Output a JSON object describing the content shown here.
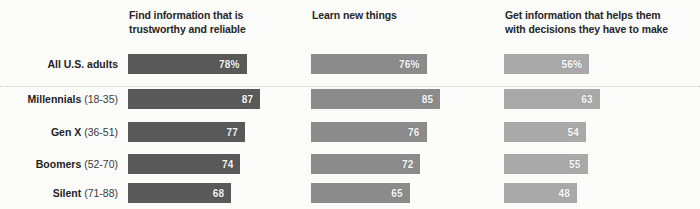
{
  "chart_data": {
    "type": "bar",
    "title": "",
    "subtitle": "",
    "xlabel": "",
    "ylabel": "",
    "orientation": "horizontal",
    "grid": false,
    "legend": "none",
    "xlim": [
      0,
      100
    ],
    "value_unit": "percent",
    "categories": [
      "All U.S. adults",
      "Millennials (18-35)",
      "Gen X (36-51)",
      "Boomers (52-70)",
      "Silent (71-88)"
    ],
    "category_parts": [
      {
        "name": "All U.S. adults",
        "age": ""
      },
      {
        "name": "Millennials",
        "age": "(18-35)"
      },
      {
        "name": "Gen X",
        "age": "(36-51)"
      },
      {
        "name": "Boomers",
        "age": "(52-70)"
      },
      {
        "name": "Silent",
        "age": "(71-88)"
      }
    ],
    "series": [
      {
        "name": "Find information that is trustworthy and reliable",
        "color": "#5a5a5a",
        "values": [
          78,
          87,
          77,
          74,
          68
        ],
        "labels": [
          "78%",
          "87",
          "77",
          "74",
          "68"
        ]
      },
      {
        "name": "Learn new things",
        "color": "#8c8c8c",
        "values": [
          76,
          85,
          76,
          72,
          65
        ],
        "labels": [
          "76%",
          "85",
          "76",
          "72",
          "65"
        ]
      },
      {
        "name": "Get information that helps them with decisions they have to make",
        "color": "#aaaaaa",
        "values": [
          56,
          63,
          54,
          55,
          48
        ],
        "labels": [
          "56%",
          "63",
          "54",
          "55",
          "48"
        ]
      }
    ]
  },
  "columns": [
    {
      "header_line1": "Find information that is",
      "header_line2": "trustworthy and reliable"
    },
    {
      "header_line1": "Learn new things",
      "header_line2": ""
    },
    {
      "header_line1": "Get information that helps them",
      "header_line2": "with decisions they have to make"
    }
  ]
}
